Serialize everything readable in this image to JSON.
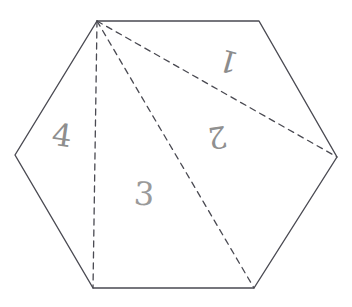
{
  "figure": {
    "shape_name": "hexagon",
    "canvas": {
      "width": 352,
      "height": 307,
      "background": "#ffffff"
    },
    "style": {
      "outline_color": "#4a4a52",
      "outline_width": 1.4,
      "dashed_color": "#4a4a52",
      "dashed_width": 1.3,
      "dash_pattern": "6 5",
      "label_color": "#8f8f8f"
    },
    "vertices": [
      {
        "name": "top-left",
        "x": 97,
        "y": 21
      },
      {
        "name": "top-right",
        "x": 259,
        "y": 21
      },
      {
        "name": "right",
        "x": 337,
        "y": 157
      },
      {
        "name": "bottom-right",
        "x": 254,
        "y": 288
      },
      {
        "name": "bottom-left",
        "x": 93,
        "y": 288
      },
      {
        "name": "left",
        "x": 15,
        "y": 155
      }
    ],
    "outline_path": "M 97 21 L 259 21 L 337 157 L 254 288 L 93 288 L 15 155 Z",
    "diagonals": [
      {
        "name": "diagonal-to-right",
        "from": "top-left",
        "to": "right",
        "x1": 97,
        "y1": 21,
        "x2": 337,
        "y2": 157
      },
      {
        "name": "diagonal-to-bottom-right",
        "from": "top-left",
        "to": "bottom-right",
        "x1": 97,
        "y1": 21,
        "x2": 254,
        "y2": 288
      },
      {
        "name": "diagonal-to-bottom-left",
        "from": "top-left",
        "to": "bottom-left",
        "x1": 97,
        "y1": 21,
        "x2": 93,
        "y2": 288
      }
    ],
    "region_labels": [
      {
        "id": "region-1",
        "text": "1",
        "x": 228,
        "y": 62,
        "region": "top-right triangle"
      },
      {
        "id": "region-2",
        "text": "2",
        "x": 220,
        "y": 140,
        "region": "right triangle"
      },
      {
        "id": "region-3",
        "text": "3",
        "x": 148,
        "y": 203,
        "region": "lower-middle triangle"
      },
      {
        "id": "region-4",
        "text": "4",
        "x": 66,
        "y": 145,
        "region": "left triangle"
      }
    ]
  }
}
